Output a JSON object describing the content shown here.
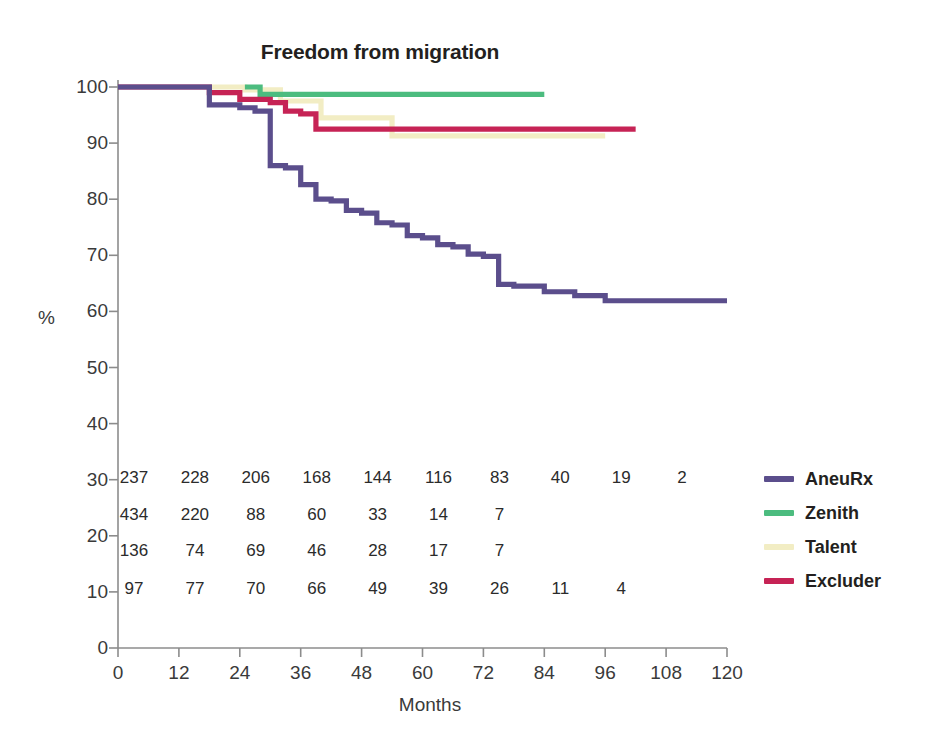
{
  "chart_data": {
    "type": "line",
    "title": "Freedom from migration",
    "xlabel": "Months",
    "ylabel": "%",
    "xlim": [
      0,
      120
    ],
    "ylim": [
      0,
      100
    ],
    "xticks": [
      0,
      12,
      24,
      36,
      48,
      60,
      72,
      84,
      96,
      108,
      120
    ],
    "yticks": [
      0,
      10,
      20,
      30,
      40,
      50,
      60,
      70,
      80,
      90,
      100
    ],
    "grid": false,
    "legend_position": "right",
    "curve_style": "step-post",
    "series": [
      {
        "name": "AneuRx",
        "color": "#5B4E8C",
        "x": [
          0,
          18,
          19,
          24,
          27,
          30,
          33,
          36,
          39,
          42,
          45,
          48,
          51,
          54,
          57,
          60,
          63,
          66,
          69,
          72,
          75,
          78,
          84,
          90,
          96,
          120
        ],
        "y": [
          100,
          96.8,
          96.8,
          96.3,
          95.7,
          86.0,
          85.6,
          82.6,
          80.0,
          79.7,
          78.0,
          77.5,
          75.8,
          75.4,
          73.5,
          73.1,
          71.9,
          71.5,
          70.2,
          69.8,
          64.8,
          64.5,
          63.5,
          62.8,
          61.9,
          61.9
        ]
      },
      {
        "name": "Zenith",
        "color": "#4CBC7F",
        "x": [
          25,
          28,
          84
        ],
        "y": [
          100,
          98.7,
          98.7
        ]
      },
      {
        "name": "Talent",
        "color": "#F2EDC4",
        "x": [
          18,
          25,
          32,
          40,
          54,
          96
        ],
        "y": [
          100,
          99.5,
          97.5,
          94.5,
          91.3,
          91.3
        ]
      },
      {
        "name": "Excluder",
        "color": "#C62355",
        "x": [
          0,
          18,
          24,
          30,
          33,
          36,
          39,
          102
        ],
        "y": [
          100,
          99.0,
          97.8,
          97.2,
          95.7,
          95.2,
          92.5,
          92.5
        ]
      }
    ],
    "risk_table": {
      "time_points": [
        0,
        12,
        24,
        36,
        48,
        60,
        72,
        84,
        96,
        108
      ],
      "rows": [
        {
          "name": "AneuRx",
          "counts": [
            "237",
            "228",
            "206",
            "168",
            "144",
            "116",
            "83",
            "40",
            "19",
            "2"
          ]
        },
        {
          "name": "Zenith",
          "counts": [
            "434",
            "220",
            "88",
            "60",
            "33",
            "14",
            "7",
            "",
            "",
            ""
          ]
        },
        {
          "name": "Talent",
          "counts": [
            "136",
            "74",
            "69",
            "46",
            "28",
            "17",
            "7",
            "",
            "",
            ""
          ]
        },
        {
          "name": "Excluder",
          "counts": [
            "97",
            "77",
            "70",
            "66",
            "49",
            "39",
            "26",
            "11",
            "4",
            ""
          ]
        }
      ]
    }
  },
  "legend": {
    "items": [
      {
        "label": "AneuRx",
        "color": "#5B4E8C"
      },
      {
        "label": "Zenith",
        "color": "#4CBC7F"
      },
      {
        "label": "Talent",
        "color": "#F2EDC4"
      },
      {
        "label": "Excluder",
        "color": "#C62355"
      }
    ]
  },
  "axis_colors": {
    "line": "#8c8c8c",
    "text": "#3a3a3a"
  }
}
